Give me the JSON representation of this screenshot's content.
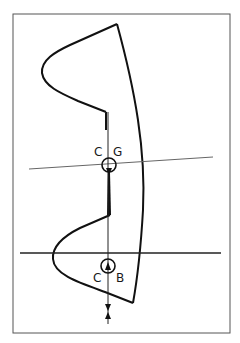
{
  "diagram": {
    "type": "hull-section stability diagram",
    "labels": {
      "cg": {
        "left": "C",
        "right": "G"
      },
      "cb": {
        "left": "C",
        "right": "B"
      }
    },
    "colors": {
      "ink": "#111111",
      "frame": "#555555",
      "thin_line": "#666666",
      "background": "#ffffff"
    }
  }
}
